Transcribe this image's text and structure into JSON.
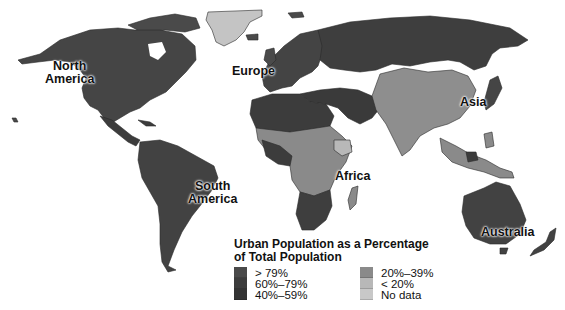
{
  "map": {
    "title": "Urban Population as a Percentage of Total Population",
    "title_line1": "Urban Population as a Percentage",
    "title_line2": "of Total Population",
    "continent_labels": [
      {
        "name": "North America",
        "line1": "North",
        "line2": "America"
      },
      {
        "name": "Europe",
        "line1": "Europe"
      },
      {
        "name": "Asia",
        "line1": "Asia"
      },
      {
        "name": "South America",
        "line1": "South",
        "line2": "America"
      },
      {
        "name": "Africa",
        "line1": "Africa"
      },
      {
        "name": "Australia",
        "line1": "Australia"
      }
    ],
    "legend": {
      "left": [
        {
          "label": "> 79%",
          "color": "#4a4a4a"
        },
        {
          "label": "60%–79%",
          "color": "#3c3c3c"
        },
        {
          "label": "40%–59%",
          "color": "#333333"
        }
      ],
      "right": [
        {
          "label": "20%–39%",
          "color": "#8a8a8a"
        },
        {
          "label": "< 20%",
          "color": "#b8b8b8"
        },
        {
          "label": "No data",
          "color": "#c8c8c8"
        }
      ]
    },
    "colors": {
      "gt79": "#4a4a4a",
      "p60_79": "#3c3c3c",
      "p40_59": "#333333",
      "p20_39": "#8a8a8a",
      "lt20": "#b8b8b8",
      "nodata": "#c8c8c8",
      "background": "#ffffff"
    }
  }
}
